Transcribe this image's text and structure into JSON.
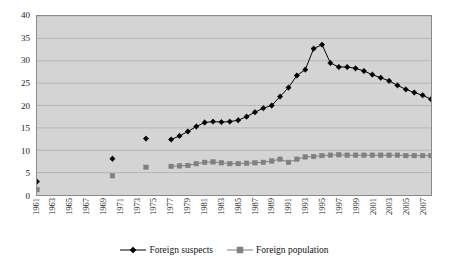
{
  "chart_data": {
    "type": "line",
    "title": "",
    "subtitle": "",
    "xlabel": "",
    "ylabel": "",
    "xlim": [
      1961,
      2008
    ],
    "ylim": [
      0,
      40
    ],
    "grid": true,
    "legend_position": "bottom",
    "y_ticks": [
      0,
      5,
      10,
      15,
      20,
      25,
      30,
      35,
      40
    ],
    "x_tick_labels": [
      "1961",
      "1963",
      "1965",
      "1967",
      "1969",
      "1971",
      "1973",
      "1975",
      "1977",
      "1979",
      "1981",
      "1983",
      "1985",
      "1987",
      "1989",
      "1991",
      "1993",
      "1995",
      "1997",
      "1999",
      "2001",
      "2003",
      "2005",
      "2007"
    ],
    "x_tick_years": [
      1961,
      1963,
      1965,
      1967,
      1969,
      1971,
      1973,
      1975,
      1977,
      1979,
      1981,
      1983,
      1985,
      1987,
      1989,
      1991,
      1993,
      1995,
      1997,
      1999,
      2001,
      2003,
      2005,
      2007
    ],
    "series": [
      {
        "name": "Foreign suspects",
        "color": "#000000",
        "marker": "diamond",
        "points": [
          {
            "x": 1961,
            "y": 3.0,
            "connected": false
          },
          {
            "x": 1970,
            "y": 8.1,
            "connected": false
          },
          {
            "x": 1974,
            "y": 12.6,
            "connected": false
          },
          {
            "x": 1977,
            "y": 12.4,
            "connected": true
          },
          {
            "x": 1978,
            "y": 13.2,
            "connected": true
          },
          {
            "x": 1979,
            "y": 14.2,
            "connected": true
          },
          {
            "x": 1980,
            "y": 15.3,
            "connected": true
          },
          {
            "x": 1981,
            "y": 16.2,
            "connected": true
          },
          {
            "x": 1982,
            "y": 16.4,
            "connected": true
          },
          {
            "x": 1983,
            "y": 16.3,
            "connected": true
          },
          {
            "x": 1984,
            "y": 16.4,
            "connected": true
          },
          {
            "x": 1985,
            "y": 16.7,
            "connected": true
          },
          {
            "x": 1986,
            "y": 17.5,
            "connected": true
          },
          {
            "x": 1987,
            "y": 18.5,
            "connected": true
          },
          {
            "x": 1988,
            "y": 19.4,
            "connected": true
          },
          {
            "x": 1989,
            "y": 20.0,
            "connected": true
          },
          {
            "x": 1990,
            "y": 22.0,
            "connected": true
          },
          {
            "x": 1991,
            "y": 24.0,
            "connected": true
          },
          {
            "x": 1992,
            "y": 26.7,
            "connected": true
          },
          {
            "x": 1993,
            "y": 28.0,
            "connected": true
          },
          {
            "x": 1994,
            "y": 32.7,
            "connected": true
          },
          {
            "x": 1995,
            "y": 33.6,
            "connected": true
          },
          {
            "x": 1996,
            "y": 29.5,
            "connected": true
          },
          {
            "x": 1997,
            "y": 28.6,
            "connected": true
          },
          {
            "x": 1998,
            "y": 28.6,
            "connected": true
          },
          {
            "x": 1999,
            "y": 28.3,
            "connected": true
          },
          {
            "x": 2000,
            "y": 27.7,
            "connected": true
          },
          {
            "x": 2001,
            "y": 26.9,
            "connected": true
          },
          {
            "x": 2002,
            "y": 26.2,
            "connected": true
          },
          {
            "x": 2003,
            "y": 25.5,
            "connected": true
          },
          {
            "x": 2004,
            "y": 24.5,
            "connected": true
          },
          {
            "x": 2005,
            "y": 23.6,
            "connected": true
          },
          {
            "x": 2006,
            "y": 22.9,
            "connected": true
          },
          {
            "x": 2007,
            "y": 22.3,
            "connected": true
          },
          {
            "x": 2008,
            "y": 21.4,
            "connected": true
          }
        ]
      },
      {
        "name": "Foreign population",
        "color": "#808080",
        "marker": "square",
        "points": [
          {
            "x": 1961,
            "y": 1.2,
            "connected": false
          },
          {
            "x": 1970,
            "y": 4.3,
            "connected": false
          },
          {
            "x": 1974,
            "y": 6.2,
            "connected": false
          },
          {
            "x": 1977,
            "y": 6.4,
            "connected": true
          },
          {
            "x": 1978,
            "y": 6.5,
            "connected": true
          },
          {
            "x": 1979,
            "y": 6.6,
            "connected": true
          },
          {
            "x": 1980,
            "y": 7.0,
            "connected": true
          },
          {
            "x": 1981,
            "y": 7.3,
            "connected": true
          },
          {
            "x": 1982,
            "y": 7.4,
            "connected": true
          },
          {
            "x": 1983,
            "y": 7.2,
            "connected": true
          },
          {
            "x": 1984,
            "y": 7.0,
            "connected": true
          },
          {
            "x": 1985,
            "y": 7.0,
            "connected": true
          },
          {
            "x": 1986,
            "y": 7.1,
            "connected": true
          },
          {
            "x": 1987,
            "y": 7.2,
            "connected": true
          },
          {
            "x": 1988,
            "y": 7.3,
            "connected": true
          },
          {
            "x": 1989,
            "y": 7.6,
            "connected": true
          },
          {
            "x": 1990,
            "y": 8.0,
            "connected": true
          },
          {
            "x": 1991,
            "y": 7.3,
            "connected": true
          },
          {
            "x": 1992,
            "y": 8.0,
            "connected": true
          },
          {
            "x": 1993,
            "y": 8.5,
            "connected": true
          },
          {
            "x": 1994,
            "y": 8.6,
            "connected": true
          },
          {
            "x": 1995,
            "y": 8.8,
            "connected": true
          },
          {
            "x": 1996,
            "y": 8.9,
            "connected": true
          },
          {
            "x": 1997,
            "y": 9.0,
            "connected": true
          },
          {
            "x": 1998,
            "y": 8.9,
            "connected": true
          },
          {
            "x": 1999,
            "y": 8.9,
            "connected": true
          },
          {
            "x": 2000,
            "y": 8.9,
            "connected": true
          },
          {
            "x": 2001,
            "y": 8.9,
            "connected": true
          },
          {
            "x": 2002,
            "y": 8.9,
            "connected": true
          },
          {
            "x": 2003,
            "y": 8.9,
            "connected": true
          },
          {
            "x": 2004,
            "y": 8.9,
            "connected": true
          },
          {
            "x": 2005,
            "y": 8.8,
            "connected": true
          },
          {
            "x": 2006,
            "y": 8.8,
            "connected": true
          },
          {
            "x": 2007,
            "y": 8.8,
            "connected": true
          },
          {
            "x": 2008,
            "y": 8.8,
            "connected": true
          }
        ]
      }
    ]
  },
  "style": {
    "plot_background": "#d4d4d4",
    "page_background": "#ffffff",
    "gridline_color": "#b0b0b0",
    "axis_color": "#8a8a8a",
    "text_color": "#1a1a1a",
    "suspects_color": "#000000",
    "population_color": "#808080"
  },
  "legend": {
    "items": [
      {
        "label": "Foreign suspects",
        "marker": "diamond",
        "color": "#000000"
      },
      {
        "label": "Foreign population",
        "marker": "square",
        "color": "#808080"
      }
    ]
  }
}
